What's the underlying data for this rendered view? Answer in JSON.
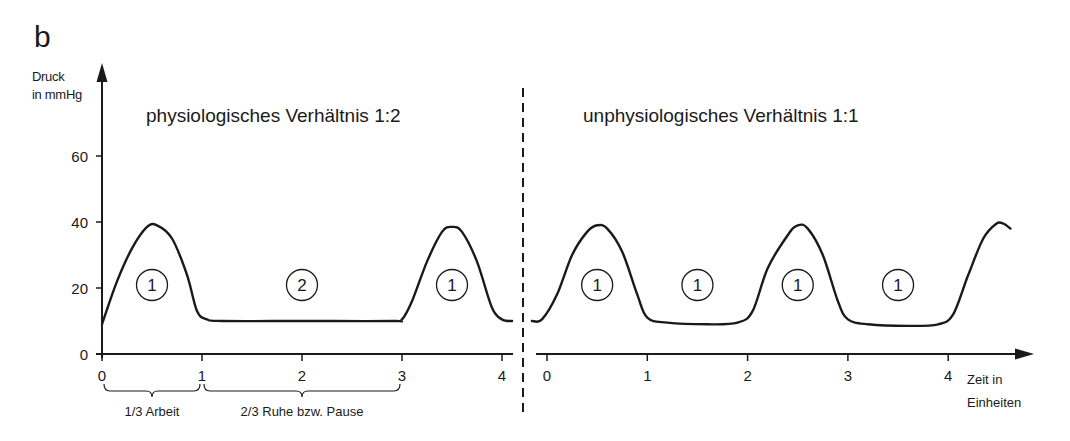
{
  "panel_label": "b",
  "chart_data": {
    "type": "line",
    "ylabel": [
      "Druck",
      "in mmHg"
    ],
    "xlabel": [
      "Zeit in",
      "Einheiten"
    ],
    "ylim": [
      0,
      70
    ],
    "yticks": [
      0,
      20,
      40,
      60
    ],
    "grid": false,
    "panels": [
      {
        "title": "physiologisches Verhältnis 1:2",
        "xlim": [
          0,
          4.1
        ],
        "xticks": [
          0,
          1,
          2,
          3,
          4
        ],
        "series": [
          {
            "name": "Druck",
            "x": [
              0,
              0.15,
              0.3,
              0.45,
              0.55,
              0.7,
              0.85,
              0.95,
              1.05,
              1.2,
              2.0,
              2.9,
              3.0,
              3.1,
              3.25,
              3.4,
              3.5,
              3.6,
              3.75,
              3.9,
              4.0,
              4.1
            ],
            "y": [
              9,
              22,
              32,
              38.5,
              39,
              35,
              24,
              13,
              10.5,
              10,
              10,
              10,
              10.5,
              16,
              28,
              37,
              38.5,
              37,
              28,
              14,
              10.5,
              10
            ]
          }
        ],
        "annotations": [
          {
            "label": "1",
            "x": 0.5,
            "y": 20
          },
          {
            "label": "2",
            "x": 2.0,
            "y": 20
          },
          {
            "label": "1",
            "x": 3.5,
            "y": 20
          }
        ],
        "braces": [
          {
            "from": 0,
            "to": 1,
            "label": "1/3 Arbeit"
          },
          {
            "from": 1,
            "to": 3,
            "label": "2/3 Ruhe bzw. Pause"
          }
        ]
      },
      {
        "title": "unphysiologisches Verhältnis 1:1",
        "xlim": [
          -0.1,
          4.8
        ],
        "xticks": [
          0,
          1,
          2,
          3,
          4
        ],
        "series": [
          {
            "name": "Druck",
            "x": [
              -0.15,
              -0.05,
              0.1,
              0.25,
              0.4,
              0.5,
              0.6,
              0.75,
              0.9,
              1.0,
              1.2,
              1.6,
              1.9,
              2.05,
              2.2,
              2.4,
              2.5,
              2.6,
              2.75,
              2.9,
              3.0,
              3.2,
              3.6,
              3.9,
              4.05,
              4.2,
              4.35,
              4.48,
              4.55,
              4.62
            ],
            "y": [
              10,
              10.5,
              18,
              30,
              37,
              39,
              38,
              31,
              18,
              11,
              9.5,
              9,
              9.5,
              13,
              26,
              36,
              39,
              38,
              30,
              16,
              10.5,
              9,
              8.5,
              9,
              12,
              24,
              35,
              39.5,
              39.5,
              38
            ]
          }
        ],
        "annotations": [
          {
            "label": "1",
            "x": 0.5,
            "y": 20
          },
          {
            "label": "1",
            "x": 1.5,
            "y": 20
          },
          {
            "label": "1",
            "x": 2.5,
            "y": 20
          },
          {
            "label": "1",
            "x": 3.5,
            "y": 20
          }
        ],
        "braces": []
      }
    ]
  }
}
